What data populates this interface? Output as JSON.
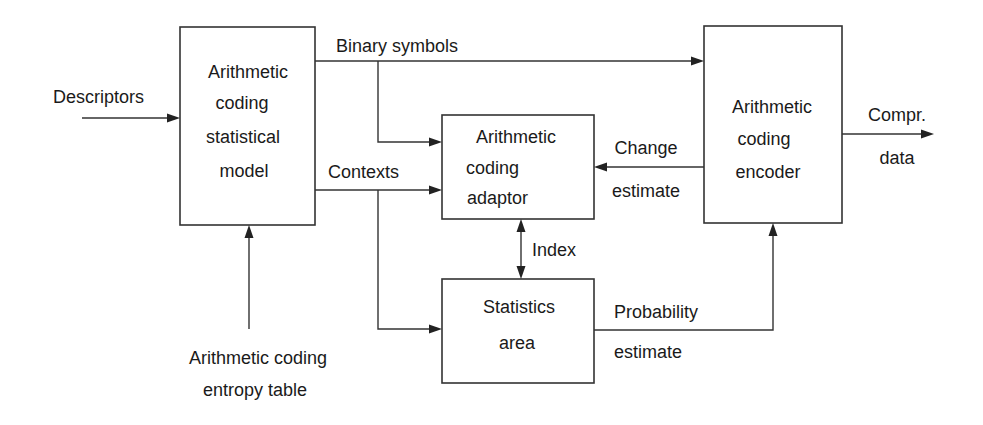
{
  "diagram": {
    "type": "block-diagram",
    "blocks": {
      "statistical_model": {
        "lines": [
          "Arithmetic",
          "coding",
          "statistical",
          "model"
        ]
      },
      "adaptor": {
        "lines": [
          "Arithmetic",
          "coding",
          "adaptor"
        ]
      },
      "encoder": {
        "lines": [
          "Arithmetic",
          "coding",
          "encoder"
        ]
      },
      "statistics_area": {
        "lines": [
          "Statistics",
          "area"
        ]
      }
    },
    "edges": {
      "descriptors": {
        "label": "Descriptors"
      },
      "binary_symbols": {
        "label": "Binary symbols"
      },
      "contexts": {
        "label": "Contexts"
      },
      "change_estimate": {
        "lines": [
          "Change",
          "estimate"
        ]
      },
      "index": {
        "label": "Index"
      },
      "probability_estimate": {
        "lines": [
          "Probability",
          "estimate"
        ]
      },
      "compressed_data": {
        "lines": [
          "Compr.",
          "data"
        ]
      },
      "entropy_table": {
        "lines": [
          "Arithmetic coding",
          "entropy table"
        ]
      }
    },
    "colors": {
      "stroke": "#333333",
      "text": "#1a1a1a",
      "background": "#ffffff"
    }
  }
}
